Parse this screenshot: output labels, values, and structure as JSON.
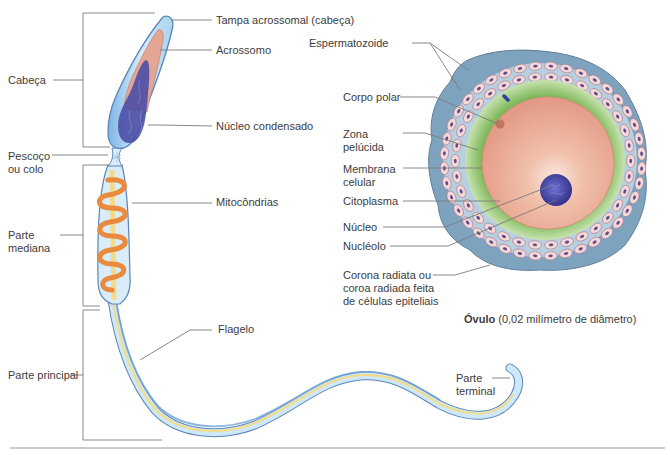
{
  "sperm": {
    "labels": {
      "tampa_acrossomal": "Tampa acrossomal (cabeça)",
      "acrossomo": "Acrossomo",
      "nucleo_condensado": "Núcleo condensado",
      "mitocondrias": "Mitocôndrias",
      "flagelo": "Flagelo",
      "parte_terminal": "Parte\nterminal"
    },
    "regions": {
      "cabeca": "Cabeça",
      "pescoco": "Pescoço\nou colo",
      "parte_mediana": "Parte\nmediana",
      "parte_principal": "Parte principal"
    }
  },
  "ovum": {
    "labels": {
      "espermatozoide": "Espermatozoide",
      "corpo_polar": "Corpo polar",
      "zona_pelucida": "Zona\npelúcida",
      "membrana_celular": "Membrana\ncelular",
      "citoplasma": "Citoplasma",
      "nucleo": "Núcleo",
      "nucleolo": "Nucléolo",
      "corona_radiata": "Corona radiata ou\ncoroa radiada feita\nde células epiteliais"
    },
    "caption": {
      "title": "Óvulo",
      "detail": "(0,02 milímetro de diâmetro)"
    }
  },
  "colors": {
    "membrane_blue": "#a9d3ef",
    "membrane_edge": "#5a86b8",
    "acrosome": "#e6a38f",
    "nucleus": "#4b4fa6",
    "mitochondria": "#e98a3c",
    "axoneme": "#f2dc8c",
    "zona_pelucida": "#8fc36b",
    "cytoplasm": "#eeb19a",
    "corona": "#7ea3bf",
    "cell_pink": "#f4d7d6",
    "leader": "#6b6b6b"
  }
}
